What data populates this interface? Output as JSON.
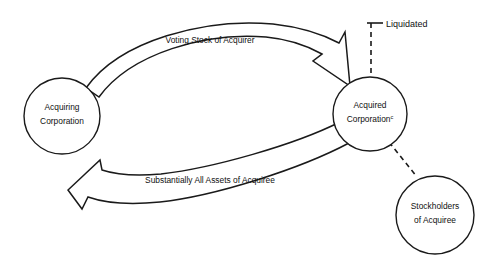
{
  "diagram": {
    "background_color": "#ffffff",
    "line_color": "#1a1a1a",
    "nodes": [
      {
        "id": "acquiring-corporation",
        "label_line1": "Acquiring",
        "label_line2": "Corporation",
        "superscript": "",
        "shape": "circle",
        "cx": 62,
        "cy": 116,
        "r": 38
      },
      {
        "id": "acquired-corporation",
        "label_line1": "Acquired",
        "label_line2": "Corporation",
        "superscript": "c",
        "shape": "circle",
        "cx": 370,
        "cy": 114,
        "r": 37
      },
      {
        "id": "stockholders-of-acquiree",
        "label_line1": "Stockholders",
        "label_line2": "of Acquiree",
        "superscript": "",
        "shape": "circle",
        "cx": 435,
        "cy": 215,
        "r": 39
      }
    ],
    "flows": [
      {
        "id": "voting-stock-flow",
        "label": "Voting Stock of Acquirer",
        "direction": "acquiring-corporation -> acquired-corporation",
        "style": "open-band-arrow",
        "label_x": 210,
        "label_y": 43
      },
      {
        "id": "assets-flow",
        "label": "Substantially All Assets of Acquiree",
        "direction": "acquired-corporation -> acquiring-corporation",
        "style": "open-band-arrow",
        "label_x": 210,
        "label_y": 183
      }
    ],
    "annotations": [
      {
        "id": "liquidated-annotation",
        "label": "Liquidated",
        "style": "dashed-leader",
        "label_x": 386,
        "label_y": 27,
        "attached_to": "acquired-corporation"
      }
    ],
    "links": [
      {
        "id": "acquired-to-stockholders-link",
        "style": "dashed",
        "from": "acquired-corporation",
        "to": "stockholders-of-acquiree"
      }
    ]
  }
}
